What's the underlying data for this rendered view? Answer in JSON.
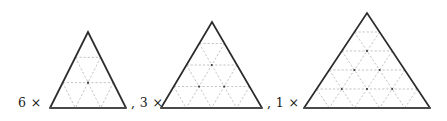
{
  "figure": {
    "background_color": "#ffffff",
    "width": 447,
    "height": 121,
    "outline_color": "#2b2b2b",
    "grid_color": "#b9b9b9",
    "vertex_dot_color": "#3a3a3a",
    "baseline_color": "#4a4a4a",
    "text_color": "#1a1a1a"
  },
  "labels": {
    "first": "6 ×",
    "second": ", 3 ×",
    "third": ", 1 ×",
    "multiplier_symbol": "×"
  },
  "chart_data": {
    "type": "diagram",
    "xlabel": "",
    "ylabel": "",
    "categories": [
      "6 ×",
      "3 ×",
      "1 ×"
    ],
    "values": [
      6,
      3,
      1
    ],
    "series": [
      {
        "name": "multiplier",
        "values": [
          6,
          3,
          1
        ]
      },
      {
        "name": "subdivision_rows",
        "values": [
          3,
          4,
          5
        ]
      },
      {
        "name": "small_triangle_count",
        "values": [
          9,
          16,
          25
        ]
      }
    ],
    "items": [
      {
        "index": 0,
        "multiplier": 6,
        "multiplier_label": "6 ×",
        "separator": "",
        "rows": 3,
        "side_length_px": 76,
        "apex_x": 88,
        "apex_y": 32,
        "base_y": 108,
        "base_left_x": 50,
        "base_right_x": 126,
        "small_triangles": 9
      },
      {
        "index": 1,
        "multiplier": 3,
        "multiplier_label": "3 ×",
        "separator": ",",
        "rows": 4,
        "side_length_px": 101,
        "apex_x": 212,
        "apex_y": 22,
        "base_y": 108,
        "base_left_x": 161,
        "base_right_x": 262,
        "small_triangles": 16
      },
      {
        "index": 2,
        "multiplier": 1,
        "multiplier_label": "1 ×",
        "separator": ",",
        "rows": 5,
        "side_length_px": 126,
        "apex_x": 367,
        "apex_y": 13,
        "base_y": 108,
        "base_left_x": 304,
        "base_right_x": 430,
        "small_triangles": 25
      }
    ],
    "label_positions": [
      {
        "text": "6 ×",
        "x": 18,
        "y": 107
      },
      {
        "text": ", 3 ×",
        "x": 131,
        "y": 107
      },
      {
        "text": ", 1 ×",
        "x": 267,
        "y": 107
      }
    ],
    "grid": true,
    "legend": "none"
  }
}
